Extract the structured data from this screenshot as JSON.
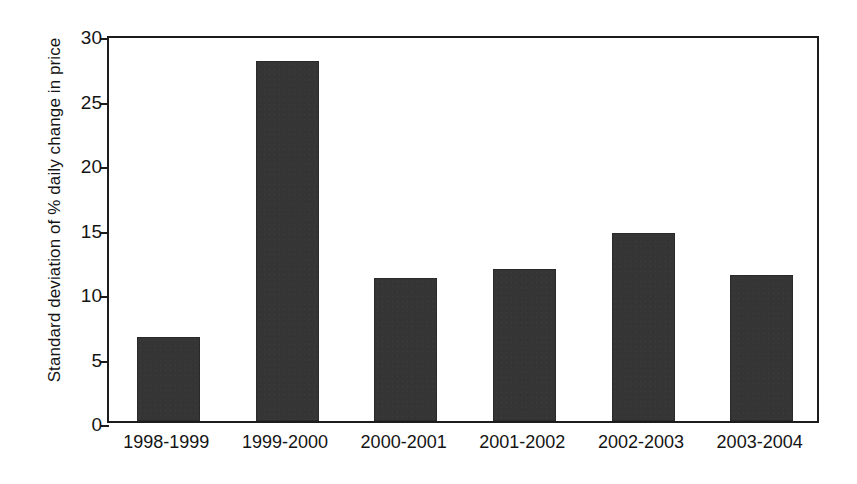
{
  "chart_data": {
    "type": "bar",
    "title": "",
    "subtitle": "",
    "xlabel": "",
    "ylabel": "Standard deviation of % daily change in price",
    "categories": [
      "1998-1999",
      "1999-2000",
      "2000-2001",
      "2001-2002",
      "2002-2003",
      "2003-2004"
    ],
    "values": [
      6.5,
      27.9,
      11.1,
      11.8,
      14.6,
      11.3
    ],
    "ylim": [
      0,
      30
    ],
    "yticks": [
      0,
      5,
      10,
      15,
      20,
      25,
      30
    ],
    "ytick_labels": [
      "0",
      "5",
      "10",
      "15",
      "20",
      "25",
      "30"
    ],
    "grid": false,
    "legend": false,
    "legend_position": "none",
    "bar_color": "#353535",
    "axis_color": "#1c1c1c",
    "background_color": "#ffffff"
  }
}
